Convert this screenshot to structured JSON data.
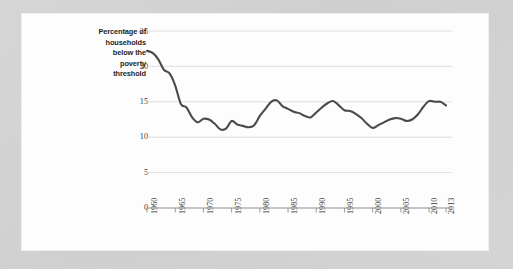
{
  "page": {
    "background_color": "#d2d2d2",
    "card_background_color": "#fdfdfd"
  },
  "chart_data": {
    "type": "line",
    "title": "",
    "subtitle": "",
    "xlabel": "",
    "ylabel": "Percentage of households below the poverty threshold",
    "ylabel_lines": [
      "Percentage of",
      "households",
      "below the",
      "poverty",
      "threshold"
    ],
    "xlim": [
      1960,
      2013
    ],
    "ylim": [
      0,
      25
    ],
    "yticks": [
      0,
      5,
      10,
      15,
      20,
      25
    ],
    "ytick_labels": [
      "0",
      "5",
      "10",
      "15",
      "20",
      "25"
    ],
    "xticks": [
      1960,
      1965,
      1970,
      1975,
      1980,
      1985,
      1990,
      1995,
      2000,
      2005,
      2010,
      2013
    ],
    "xtick_labels": [
      "1960",
      "1965",
      "1970",
      "1975",
      "1980",
      "1985",
      "1990",
      "1995",
      "2000",
      "2005",
      "2010",
      "2013"
    ],
    "grid": "horizontal",
    "legend": "none",
    "line_color": "#4a4a4a",
    "grid_color": "#d8d8d8",
    "axis_color": "#8e8e8e",
    "series": [
      {
        "name": "Percentage of households below the poverty threshold",
        "x": [
          1960,
          1961,
          1962,
          1963,
          1964,
          1965,
          1966,
          1967,
          1968,
          1969,
          1970,
          1971,
          1972,
          1973,
          1974,
          1975,
          1976,
          1977,
          1978,
          1979,
          1980,
          1981,
          1982,
          1983,
          1984,
          1985,
          1986,
          1987,
          1988,
          1989,
          1990,
          1991,
          1992,
          1993,
          1994,
          1995,
          1996,
          1997,
          1998,
          1999,
          2000,
          2001,
          2002,
          2003,
          2004,
          2005,
          2006,
          2007,
          2008,
          2009,
          2010,
          2011,
          2012,
          2013
        ],
        "values": [
          22.2,
          21.9,
          21.0,
          19.5,
          19.0,
          17.3,
          14.7,
          14.2,
          12.8,
          12.1,
          12.6,
          12.5,
          11.9,
          11.1,
          11.2,
          12.3,
          11.8,
          11.6,
          11.4,
          11.7,
          13.0,
          14.0,
          15.0,
          15.2,
          14.4,
          14.0,
          13.6,
          13.4,
          13.0,
          12.8,
          13.5,
          14.2,
          14.8,
          15.1,
          14.5,
          13.8,
          13.7,
          13.3,
          12.7,
          11.9,
          11.3,
          11.7,
          12.1,
          12.5,
          12.7,
          12.6,
          12.3,
          12.5,
          13.2,
          14.3,
          15.1,
          15.0,
          15.0,
          14.5
        ]
      }
    ]
  }
}
